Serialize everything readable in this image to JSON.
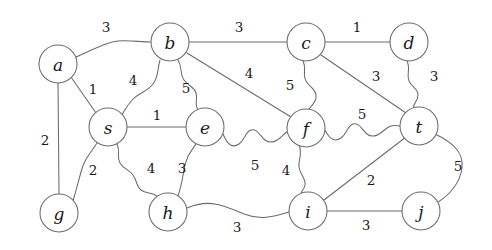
{
  "figure": {
    "type": "undirected-weighted-graph",
    "background_color": "#ffffff",
    "stroke_color": "#6b6b6b",
    "text_color": "#1a1a1a",
    "width": 492,
    "height": 250
  },
  "nodes": [
    {
      "id": "a",
      "label": "a",
      "cx": 58,
      "cy": 64,
      "r": 19
    },
    {
      "id": "b",
      "label": "b",
      "cx": 170,
      "cy": 42,
      "r": 19
    },
    {
      "id": "c",
      "label": "c",
      "cx": 306,
      "cy": 42,
      "r": 19
    },
    {
      "id": "d",
      "label": "d",
      "cx": 409,
      "cy": 42,
      "r": 19
    },
    {
      "id": "s",
      "label": "s",
      "cx": 108,
      "cy": 127,
      "r": 19
    },
    {
      "id": "e",
      "label": "e",
      "cx": 205,
      "cy": 127,
      "r": 19
    },
    {
      "id": "f",
      "label": "f",
      "cx": 306,
      "cy": 128,
      "r": 19
    },
    {
      "id": "t",
      "label": "t",
      "cx": 419,
      "cy": 126,
      "r": 19
    },
    {
      "id": "g",
      "label": "g",
      "cx": 59,
      "cy": 213,
      "r": 19
    },
    {
      "id": "h",
      "label": "h",
      "cx": 168,
      "cy": 212,
      "r": 19
    },
    {
      "id": "i",
      "label": "i",
      "cx": 308,
      "cy": 211,
      "r": 19
    },
    {
      "id": "j",
      "label": "j",
      "cx": 421,
      "cy": 211,
      "r": 19
    }
  ],
  "edges": [
    {
      "id": "a-b",
      "source": "a",
      "target": "b",
      "weight": "3",
      "label_x": 106,
      "label_y": 27,
      "path": "M 76 57 C 100 46 108 42 118 41 C 130 40 140 42 151 42"
    },
    {
      "id": "a-s",
      "source": "a",
      "target": "s",
      "weight": "1",
      "label_x": 93,
      "label_y": 89,
      "path": "M 71 77 L 96 113"
    },
    {
      "id": "a-g",
      "source": "a",
      "target": "g",
      "weight": "2",
      "label_x": 45,
      "label_y": 140,
      "path": "M 58 83 L 59 194"
    },
    {
      "id": "b-c",
      "source": "b",
      "target": "c",
      "weight": "3",
      "label_x": 239,
      "label_y": 27,
      "path": "M 189 42 L 287 42"
    },
    {
      "id": "b-s",
      "source": "b",
      "target": "s",
      "weight": "4",
      "label_x": 133,
      "label_y": 80,
      "path": "M 160 60 C 157 70 159 76 153 84 C 147 92 140 92 133 99 C 127 105 125 110 122 115"
    },
    {
      "id": "b-e",
      "source": "b",
      "target": "e",
      "weight": "5",
      "label_x": 186,
      "label_y": 88,
      "path": "M 178 60 C 183 68 179 73 184 80 C 189 87 194 86 196 93 C 198 100 194 104 198 110"
    },
    {
      "id": "b-f",
      "source": "b",
      "target": "f",
      "weight": "4",
      "label_x": 249,
      "label_y": 73,
      "path": "M 187 53 L 291 117"
    },
    {
      "id": "c-d",
      "source": "c",
      "target": "d",
      "weight": "1",
      "label_x": 357,
      "label_y": 27,
      "path": "M 325 42 L 390 42"
    },
    {
      "id": "c-f",
      "source": "c",
      "target": "f",
      "weight": "5",
      "label_x": 290,
      "label_y": 85,
      "path": "M 303 61 C 307 69 302 74 306 81 C 310 88 315 88 316 95 C 317 102 311 106 309 109"
    },
    {
      "id": "c-t",
      "source": "c",
      "target": "t",
      "weight": "3",
      "label_x": 376,
      "label_y": 76,
      "path": "M 321 55 L 406 113"
    },
    {
      "id": "d-t",
      "source": "d",
      "target": "t",
      "weight": "3",
      "label_x": 434,
      "label_y": 76,
      "path": "M 407 61 C 411 69 406 74 409 81 C 412 88 418 88 418 95 C 418 102 412 104 414 108"
    },
    {
      "id": "s-e",
      "source": "s",
      "target": "e",
      "weight": "1",
      "label_x": 157,
      "label_y": 115,
      "path": "M 127 127 L 186 127"
    },
    {
      "id": "s-g",
      "source": "s",
      "target": "g",
      "weight": "2",
      "label_x": 93,
      "label_y": 170,
      "path": "M 97 143 C 89 155 84 160 81 172 C 78 183 76 191 73 201"
    },
    {
      "id": "s-h",
      "source": "s",
      "target": "h",
      "weight": "4",
      "label_x": 151,
      "label_y": 168,
      "path": "M 117 144 C 121 152 116 156 120 163 C 124 170 130 170 133 175 C 137 180 136 186 141 190 C 146 194 152 192 157 196"
    },
    {
      "id": "e-f",
      "source": "e",
      "target": "f",
      "weight": "5",
      "label_x": 255,
      "label_y": 165,
      "path": "M 223 134 C 228 146 233 148 239 144 C 245 140 245 132 251 130 C 257 128 260 136 265 140 C 270 144 275 142 280 138 C 285 134 286 130 292 132"
    },
    {
      "id": "e-h",
      "source": "e",
      "target": "h",
      "weight": "3",
      "label_x": 182,
      "label_y": 168,
      "path": "M 196 144 C 189 154 186 158 184 170 C 182 182 180 191 177 199"
    },
    {
      "id": "f-i",
      "source": "f",
      "target": "i",
      "weight": "4",
      "label_x": 286,
      "label_y": 170,
      "path": "M 299 145 C 303 154 298 159 299 167 C 300 175 306 178 305 185 C 304 191 299 192 301 197"
    },
    {
      "id": "f-t",
      "source": "f",
      "target": "t",
      "weight": "5",
      "label_x": 362,
      "label_y": 114,
      "path": "M 325 130 C 330 140 335 142 341 138 C 347 134 347 126 353 124 C 359 122 362 130 367 134 C 372 138 377 136 382 132 C 387 128 390 124 400 126"
    },
    {
      "id": "h-i",
      "source": "h",
      "target": "i",
      "weight": "3",
      "label_x": 237,
      "label_y": 227,
      "path": "M 187 208 C 210 198 225 206 244 214 C 262 221 275 216 289 212"
    },
    {
      "id": "i-t",
      "source": "i",
      "target": "t",
      "weight": "2",
      "label_x": 371,
      "label_y": 180,
      "path": "M 324 200 L 406 137"
    },
    {
      "id": "i-j",
      "source": "i",
      "target": "j",
      "weight": "3",
      "label_x": 366,
      "label_y": 225,
      "path": "M 327 211 L 402 211"
    },
    {
      "id": "t-j",
      "source": "t",
      "target": "j",
      "weight": "5",
      "label_x": 458,
      "label_y": 166,
      "path": "M 435 134 C 452 142 464 152 462 168 C 460 184 448 196 438 202"
    }
  ]
}
